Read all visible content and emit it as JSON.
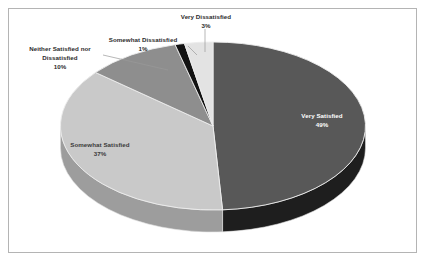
{
  "chart_data": {
    "type": "pie",
    "title": "",
    "subtitle": "",
    "xlabel": "",
    "ylabel": "",
    "legend_position": "none",
    "three_d": true,
    "grid": false,
    "total": 100,
    "unit": "%",
    "categories": [
      "Very Satisfied",
      "Somewhat Satisfied",
      "Neither Satisfied nor Dissatisfied",
      "Somewhat Dissatisfied",
      "Very Dissatisfied"
    ],
    "values": [
      49,
      37,
      10,
      1,
      3
    ],
    "slices": [
      {
        "label": "Very Satisfied",
        "value": 49,
        "pct_text": "49%",
        "color": "#585858",
        "side_color": "#1e1e1e",
        "label_placement": "inside"
      },
      {
        "label": "Somewhat Satisfied",
        "value": 37,
        "pct_text": "37%",
        "color": "#c9c9c9",
        "side_color": "#9d9d9d",
        "label_placement": "inside"
      },
      {
        "label": "Neither Satisfied nor Dissatisfied",
        "value": 10,
        "pct_text": "10%",
        "color": "#8e8e8e",
        "side_color": "#8e8e8e",
        "label_placement": "outside"
      },
      {
        "label": "Somewhat Dissatisfied",
        "value": 1,
        "pct_text": "1%",
        "color": "#121212",
        "side_color": "#121212",
        "label_placement": "outside"
      },
      {
        "label": "Very Dissatisfied",
        "value": 3,
        "pct_text": "3%",
        "color": "#e3e3e3",
        "side_color": "#bdbdbd",
        "label_placement": "outside"
      }
    ],
    "background_color": "#ffffff",
    "border_color": "#b4b4b4",
    "label_text_color": "#2b2b2b"
  }
}
